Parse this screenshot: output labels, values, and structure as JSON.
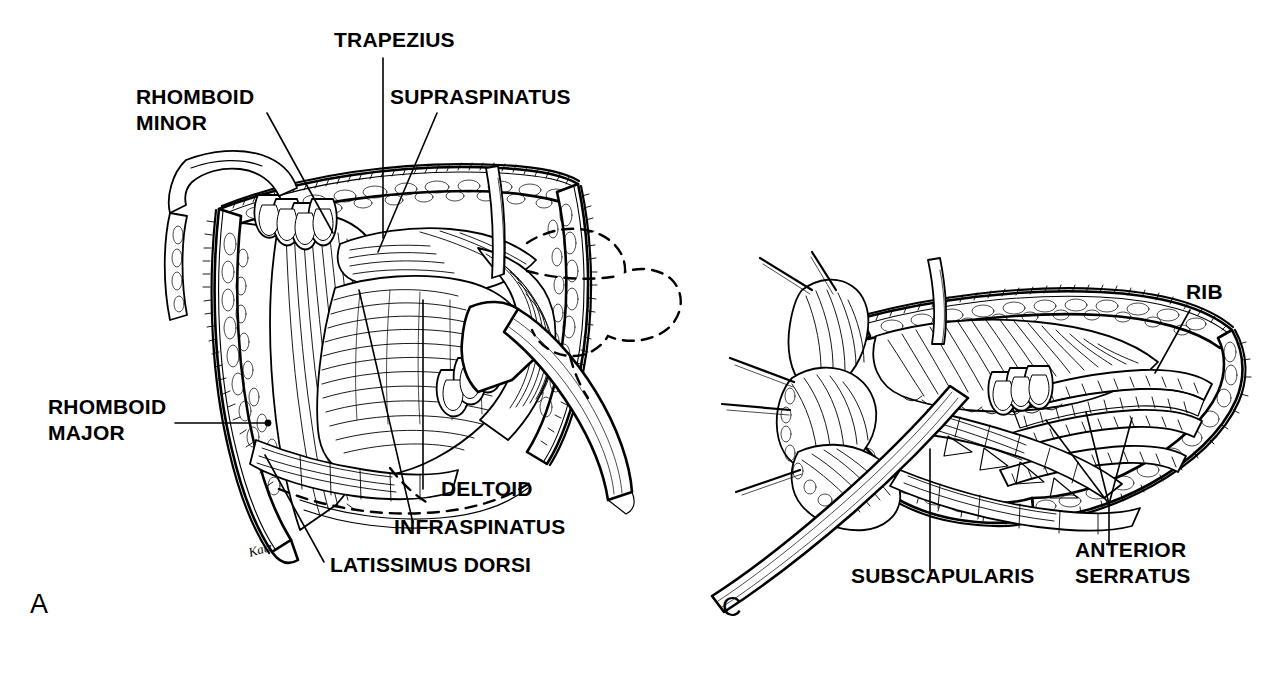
{
  "figure": {
    "background_color": "#ffffff",
    "ink_color": "#000000",
    "style": "pen-and-ink surgical anatomy line drawing",
    "width": 1281,
    "height": 674
  },
  "panels": [
    {
      "id": "panel-a",
      "letter": "A",
      "letter_x": 30,
      "letter_y": 613,
      "description": "Posterior thoracotomy exposure showing retracted trapezius with rhomboid, supraspinatus, infraspinatus, deltoid and latissimus dorsi muscles",
      "labels": [
        {
          "name": "trapezius",
          "lines": [
            "TRAPEZIUS"
          ],
          "text_x": 334,
          "text_y": 47,
          "anchor": "start",
          "leader": [
            [
              383,
              58
            ],
            [
              383,
              238
            ]
          ]
        },
        {
          "name": "rhomboid-minor",
          "lines": [
            "RHOMBOID",
            "MINOR"
          ],
          "text_x": 136,
          "text_y": 104,
          "anchor": "start",
          "leader": [
            [
              267,
              113
            ],
            [
              333,
              233
            ]
          ]
        },
        {
          "name": "supraspinatus",
          "lines": [
            "SUPRASPINATUS"
          ],
          "text_x": 390,
          "text_y": 104,
          "anchor": "start",
          "leader": [
            [
              437,
              113
            ],
            [
              378,
              252
            ]
          ]
        },
        {
          "name": "rhomboid-major",
          "lines": [
            "RHOMBOID",
            "MAJOR"
          ],
          "text_x": 48,
          "text_y": 414,
          "anchor": "start",
          "leader": [
            [
              175,
              423
            ],
            [
              268,
              423
            ]
          ]
        },
        {
          "name": "deltoid",
          "lines": [
            "DELTOID"
          ],
          "text_x": 441,
          "text_y": 496,
          "anchor": "start",
          "leader": [
            [
              423,
              489
            ],
            [
              423,
              300
            ]
          ]
        },
        {
          "name": "infraspinatus",
          "lines": [
            "INFRASPINATUS"
          ],
          "text_x": 394,
          "text_y": 534,
          "anchor": "start",
          "leader": [
            [
              413,
              523
            ],
            [
              359,
              290
            ]
          ]
        },
        {
          "name": "latissimus-dorsi",
          "lines": [
            "LATISSIMUS DORSI"
          ],
          "text_x": 330,
          "text_y": 572,
          "anchor": "start",
          "leader": [
            [
              324,
              562
            ],
            [
              265,
              455
            ]
          ]
        }
      ]
    },
    {
      "id": "panel-c",
      "letter": "C",
      "letter_x": 722,
      "letter_y": 616,
      "description": "Deeper exposure after scapula elevation showing subscapularis, anterior serratus slips and ribs",
      "labels": [
        {
          "name": "rib",
          "lines": [
            "RIB"
          ],
          "text_x": 1186,
          "text_y": 299,
          "anchor": "start",
          "leader": [
            [
              1190,
              310
            ],
            [
              1155,
              373
            ]
          ]
        },
        {
          "name": "subscapularis",
          "lines": [
            "SUBSCAPULARIS"
          ],
          "text_x": 851,
          "text_y": 583,
          "anchor": "start",
          "leader": [
            [
              930,
              571
            ],
            [
              930,
              449
            ]
          ]
        },
        {
          "name": "anterior-serratus",
          "lines": [
            "ANTERIOR",
            "SERRATUS"
          ],
          "text_x": 1075,
          "text_y": 557,
          "anchor": "start",
          "leader": [
            [
              1109,
              545
            ],
            [
              1109,
              504
            ]
          ]
        }
      ]
    }
  ],
  "signature": {
    "text": "Katz",
    "x": 250,
    "y": 557
  }
}
